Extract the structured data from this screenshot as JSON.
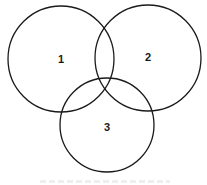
{
  "diagram": {
    "type": "venn",
    "stroke_color": "#1a1a1a",
    "background": "#ffffff",
    "circles": [
      {
        "id": "1",
        "label": "1",
        "cx": 61,
        "cy": 59,
        "r": 53
      },
      {
        "id": "2",
        "label": "2",
        "cx": 148,
        "cy": 58,
        "r": 53
      },
      {
        "id": "3",
        "label": "3",
        "cx": 107,
        "cy": 125,
        "r": 47
      }
    ]
  }
}
